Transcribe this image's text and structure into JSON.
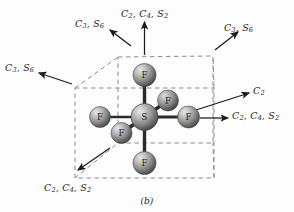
{
  "figure": {
    "caption": "(b)",
    "molecule": {
      "center_atom": "S",
      "ligand_atom": "F",
      "ligand_count": 6
    },
    "atoms": [
      {
        "id": "center",
        "label": "S",
        "cx": 144.5,
        "cy": 117.0,
        "r": 13.5,
        "depth": "mid"
      },
      {
        "id": "top",
        "label": "F",
        "cx": 144.5,
        "cy": 75.0,
        "r": 11.5,
        "depth": "mid"
      },
      {
        "id": "bottom",
        "label": "F",
        "cx": 144.5,
        "cy": 163.0,
        "r": 11.5,
        "depth": "mid"
      },
      {
        "id": "left",
        "label": "F",
        "cx": 100.0,
        "cy": 117.0,
        "r": 10.5,
        "depth": "mid"
      },
      {
        "id": "right",
        "label": "F",
        "cx": 188.5,
        "cy": 117.0,
        "r": 11.0,
        "depth": "mid"
      },
      {
        "id": "back-upper",
        "label": "F",
        "cx": 168.0,
        "cy": 100.5,
        "r": 10.5,
        "depth": "back"
      },
      {
        "id": "front-lower",
        "label": "F",
        "cx": 121.5,
        "cy": 133.0,
        "r": 10.5,
        "depth": "front"
      }
    ],
    "labels": [
      {
        "id": "top-c2c4s2",
        "text": "C2, C4, S2",
        "terms": [
          "C2",
          "C4",
          "S2"
        ],
        "x": 121,
        "y": 8,
        "axis": "vertical-up"
      },
      {
        "id": "upper-left-c3s6",
        "text": "C3, S6",
        "terms": [
          "C3",
          "S6"
        ],
        "x": 75,
        "y": 18,
        "axis": "cube-diagonal"
      },
      {
        "id": "upper-right-c3s6",
        "text": "C3, S6",
        "terms": [
          "C3",
          "S6"
        ],
        "x": 224,
        "y": 22,
        "axis": "cube-diagonal"
      },
      {
        "id": "left-c3s6",
        "text": "C3, S6",
        "terms": [
          "C3",
          "S6"
        ],
        "x": 5,
        "y": 62,
        "axis": "cube-diagonal"
      },
      {
        "id": "right-c2",
        "text": "C2",
        "terms": [
          "C2"
        ],
        "x": 253,
        "y": 85,
        "axis": "edge-diagonal"
      },
      {
        "id": "right-c2c4s2",
        "text": "C2, C4, S2",
        "terms": [
          "C2",
          "C4",
          "S2"
        ],
        "x": 232,
        "y": 110,
        "axis": "horizontal-right"
      },
      {
        "id": "lower-left-c2c4s2",
        "text": "C2, C4, S2",
        "terms": [
          "C2",
          "C4",
          "S2"
        ],
        "x": 44,
        "y": 182,
        "axis": "edge-diagonal"
      }
    ],
    "colors": {
      "background": "#fdfdfd",
      "sphere_light": "#d8d8d8",
      "sphere_mid": "#9a9a9a",
      "sphere_dark": "#4e4e4e",
      "bond": "#2b2b2b",
      "cube_dashed": "#8c8c8c",
      "arrow": "#1c1c1c",
      "text": "#1c1c1c"
    }
  }
}
